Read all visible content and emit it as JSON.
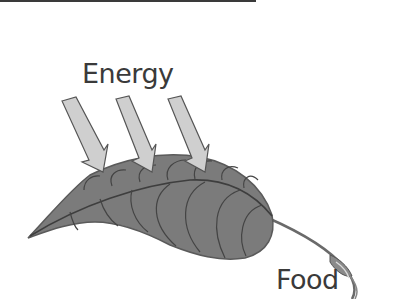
{
  "diagram": {
    "labels": {
      "energy": "Energy",
      "food": "Food"
    },
    "elements": {
      "arrows_count": 3,
      "leaf": "leaf-with-veins",
      "stem": "curled-stem"
    },
    "colors": {
      "leaf_fill": "#7a7a7a",
      "leaf_outline": "#555555",
      "vein": "#3e3e3e",
      "arrow_fill": "#cfcfcf",
      "arrow_outline": "#555555",
      "text": "#3a3a3a",
      "box_border": "#3a3a3a"
    }
  }
}
